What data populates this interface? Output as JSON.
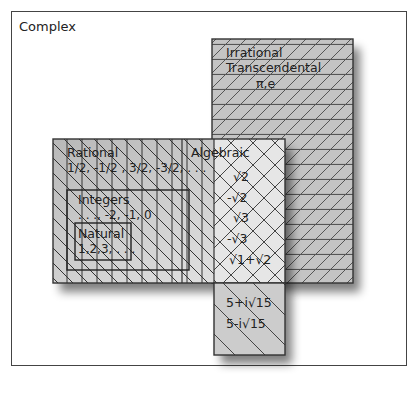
{
  "diagram": {
    "sets": {
      "complex": {
        "label": "Complex",
        "examples": [
          "5+i√15",
          "5-i√15"
        ]
      },
      "irrational": {
        "label": "Irrational",
        "sublabel": "Transcendental",
        "examples": "π,e"
      },
      "rational": {
        "label": "Rational",
        "examples": "1/2, -1/2 , 3/2, -3/2, . . ."
      },
      "integers": {
        "label": "Integers",
        "examples": ". . ., -2, -1, 0"
      },
      "natural": {
        "label": "Natural",
        "examples": "1,2,3, . . ."
      },
      "algebraic": {
        "label": "Algebraic",
        "examples": [
          "√2",
          "-√2",
          "√3",
          "-√3",
          "√1+√2"
        ]
      }
    },
    "colors": {
      "fill_gray": "#c8c8c8",
      "fill_light": "#e4e4e4",
      "line": "#333333",
      "background": "#ffffff"
    }
  }
}
